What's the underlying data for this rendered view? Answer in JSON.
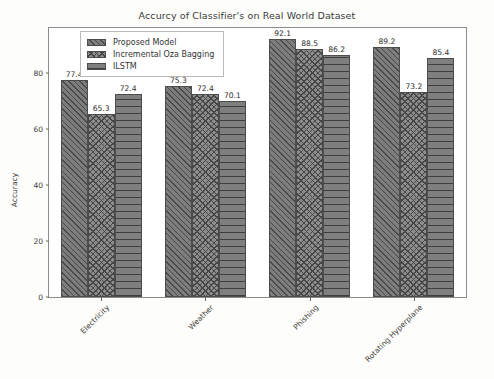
{
  "chart_data": {
    "type": "bar",
    "title": "Accurcy of Classifier's on Real World Dataset",
    "xlabel": "",
    "ylabel": "Accuracy",
    "ylim": [
      0,
      96
    ],
    "yticks": [
      0,
      20,
      40,
      60,
      80
    ],
    "grid": false,
    "legend_position": "upper left",
    "categories": [
      "Electricity",
      "Weather",
      "Phishing",
      "Rotating Hyperplane"
    ],
    "series": [
      {
        "name": "Proposed Model",
        "pattern": "diagonal-hatch",
        "color": "#7d7d7d",
        "values": [
          77.4,
          75.3,
          92.1,
          89.2
        ]
      },
      {
        "name": "Incremental Oza Bagging",
        "pattern": "cross-hatch",
        "color": "#8d8d8d",
        "values": [
          65.3,
          72.4,
          88.5,
          73.2
        ]
      },
      {
        "name": "ILSTM",
        "pattern": "horizontal-lines",
        "color": "#7f7f7f",
        "values": [
          72.4,
          70.1,
          86.2,
          85.4
        ]
      }
    ],
    "value_labels": [
      [
        "77.4",
        "65.3",
        "72.4"
      ],
      [
        "75.3",
        "72.4",
        "70.1"
      ],
      [
        "92.1",
        "88.5",
        "86.2"
      ],
      [
        "89.2",
        "73.2",
        "85.4"
      ]
    ],
    "ytick_labels": [
      "0",
      "20",
      "40",
      "60",
      "80"
    ],
    "colors": {
      "axis": "#8c8c8c",
      "text": "#3c3c3c",
      "background": "#ffffff",
      "figure_background": "#fdfdfb"
    }
  }
}
